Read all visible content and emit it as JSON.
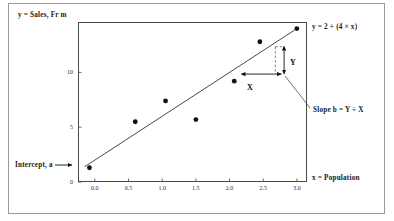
{
  "chart_data": {
    "type": "scatter",
    "title": "",
    "subtitle": "",
    "xlabel": "x = Population",
    "ylabel": "y = Sales, Fr m",
    "xlim": [
      -0.25,
      3.15
    ],
    "ylim": [
      0,
      14.6
    ],
    "grid": false,
    "legend": null,
    "xticks": [
      "0.0",
      "0.5",
      "1.0",
      "1.5",
      "2.0",
      "2.5",
      "3.0"
    ],
    "xtick_values": [
      0.0,
      0.5,
      1.0,
      1.5,
      2.0,
      2.5,
      3.0
    ],
    "yticks": [
      "0",
      "5",
      "10"
    ],
    "ytick_values": [
      0,
      5,
      10
    ],
    "series": [
      {
        "name": "observations",
        "marker": "filled-circle",
        "color": "#111111",
        "points": [
          {
            "x": -0.08,
            "y": 1.3
          },
          {
            "x": 0.6,
            "y": 5.5
          },
          {
            "x": 1.05,
            "y": 7.4
          },
          {
            "x": 1.5,
            "y": 5.7
          },
          {
            "x": 2.07,
            "y": 9.2
          },
          {
            "x": 2.45,
            "y": 12.8
          },
          {
            "x": 3.0,
            "y": 14.0
          }
        ]
      }
    ],
    "fit_line": {
      "name": "regression-line",
      "equation": "y = 2 + (4 × x)",
      "intercept": 2,
      "slope": 4,
      "x_start": -0.15,
      "x_end": 3.0,
      "color": "#333333"
    },
    "slope_triangle": {
      "x_arrow_label": "X",
      "y_arrow_label": "Y",
      "x_from": 2.18,
      "x_to": 2.77,
      "y_level": 9.85,
      "y_from": 9.85,
      "y_to": 12.35,
      "y_at_x": 2.81
    },
    "annotations": [
      {
        "name": "equation-label",
        "text": "y = 2 + (4 × x)"
      },
      {
        "name": "slope-label",
        "text": "Slope b = Y ÷ X"
      },
      {
        "name": "intercept-label",
        "text": "Intercept, a"
      }
    ]
  },
  "axes": {
    "ylabel": "y = Sales, Fr m",
    "xlabel": "x = Population"
  },
  "labels": {
    "equation": "y = 2 + (4 × x)",
    "slope": "Slope b = Y ÷ X",
    "intercept": "Intercept, a",
    "rise": "Y",
    "run": "X"
  },
  "colors": {
    "frame": "#9a9a9a",
    "axis": "#4a4a4a",
    "marker": "#111111",
    "line": "#333333",
    "dashed": "#555555",
    "text": "#1a1a1a",
    "background": "#ffffff"
  }
}
